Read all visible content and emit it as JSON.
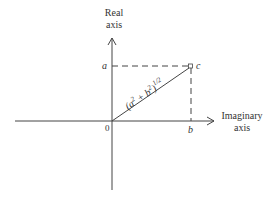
{
  "diagram": {
    "colors": {
      "line": "#444444",
      "text": "#333333",
      "background": "#ffffff"
    },
    "axes": {
      "vertical_label_line1": "Real",
      "vertical_label_line2": "axis",
      "horizontal_label_line1": "Imaginary",
      "horizontal_label_line2": "axis"
    },
    "labels": {
      "origin": "0",
      "a": "a",
      "b": "b",
      "c": "c",
      "magnitude_base": "(a",
      "magnitude_sq1": "2",
      "magnitude_plus": " + b",
      "magnitude_sq2": "2",
      "magnitude_close": ")",
      "magnitude_exp": "1/2"
    }
  }
}
